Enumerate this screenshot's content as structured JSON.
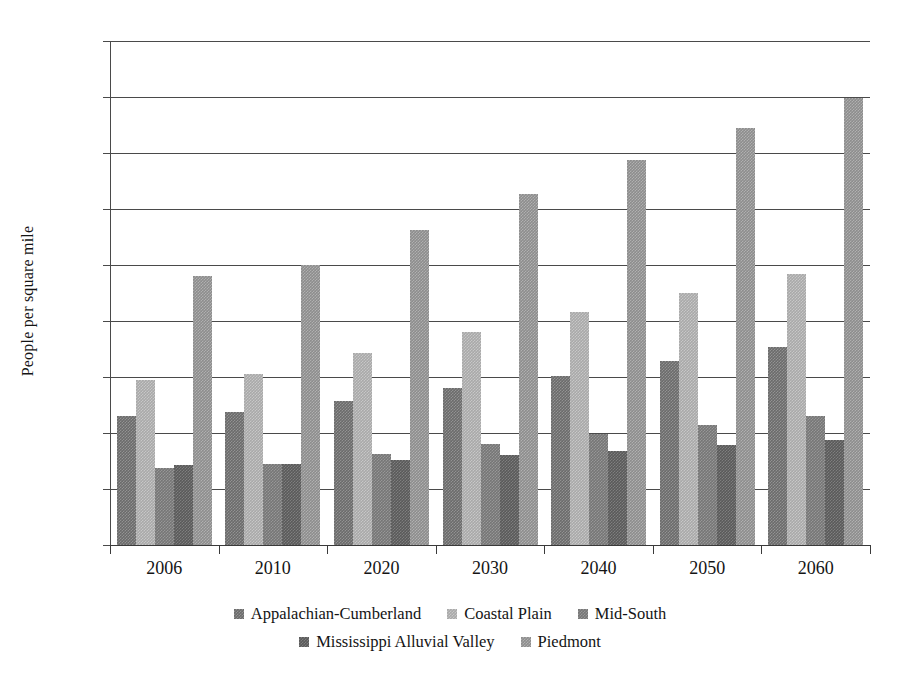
{
  "chart_data": {
    "type": "bar",
    "title": "",
    "subtitle": "",
    "xlabel": "",
    "ylabel": "People per square mile",
    "categories": [
      "2006",
      "2010",
      "2020",
      "2030",
      "2040",
      "2050",
      "2060"
    ],
    "ylim": [
      0,
      450
    ],
    "ytick_labels": [
      "0",
      "50",
      "100",
      "150",
      "200",
      "250",
      "300",
      "350",
      "400",
      "450"
    ],
    "ytick_values": [
      0,
      50,
      100,
      150,
      200,
      250,
      300,
      350,
      400,
      450
    ],
    "grid": true,
    "legend_position": "bottom",
    "series": [
      {
        "name": "Appalachian-Cumberland",
        "color": "#6b6b6b",
        "values": [
          115,
          119,
          129,
          140,
          151,
          164,
          177
        ]
      },
      {
        "name": "Coastal Plain",
        "color": "#a9a9a9",
        "values": [
          147,
          153,
          171,
          190,
          208,
          225,
          242
        ]
      },
      {
        "name": "Mid-South",
        "color": "#767676",
        "values": [
          69,
          72,
          81,
          90,
          99,
          107,
          115
        ]
      },
      {
        "name": "Mississippi Alluvial Valley",
        "color": "#5a5a5a",
        "values": [
          71,
          72,
          76,
          80,
          84,
          89,
          94
        ]
      },
      {
        "name": "Piedmont",
        "color": "#8d8d8d",
        "values": [
          240,
          250,
          281,
          313,
          344,
          372,
          399
        ]
      }
    ]
  },
  "legend": {
    "rows": [
      [
        "Appalachian-Cumberland",
        "Coastal Plain",
        "Mid-South"
      ],
      [
        "Mississippi Alluvial Valley",
        "Piedmont"
      ]
    ]
  }
}
